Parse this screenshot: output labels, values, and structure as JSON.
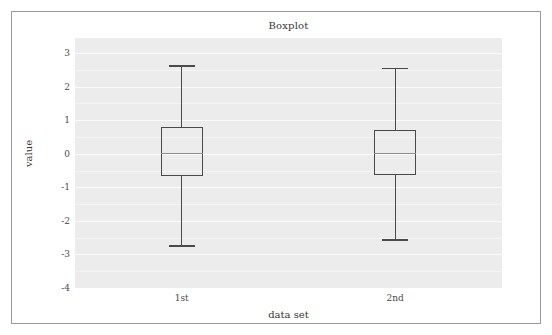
{
  "figure": {
    "title": "Boxplot",
    "xlabel": "data set",
    "ylabel": "value",
    "background_color": "#ffffff",
    "plot_background_color": "#ebebeb",
    "gridline_color": "#ffffff",
    "border_color": "#9a9a9a",
    "artist_color": "#4a4a4a",
    "median_color": "#8d8d8d"
  },
  "chart_data": {
    "type": "box",
    "title": "Boxplot",
    "xlabel": "data set",
    "ylabel": "value",
    "categories": [
      "1st",
      "2nd"
    ],
    "xtick_labels": [
      "1st",
      "2nd"
    ],
    "ytick_labels": [
      "3",
      "2",
      "1",
      "0",
      "-1",
      "-2",
      "-3",
      "-4"
    ],
    "ytick_values": [
      3,
      2,
      1,
      0,
      -1,
      -2,
      -3,
      -4
    ],
    "ylim": [
      -4.0,
      3.45
    ],
    "xlim": [
      0.5,
      2.5
    ],
    "grid": true,
    "grid_axis": "y",
    "legend": false,
    "series": [
      {
        "name": "1st",
        "position": 1,
        "whisker_low": -2.72,
        "q1": -0.67,
        "median": 0.02,
        "q3": 0.79,
        "whisker_high": 2.64,
        "outliers": []
      },
      {
        "name": "2nd",
        "position": 2,
        "whisker_low": -2.55,
        "q1": -0.63,
        "median": 0.01,
        "q3": 0.72,
        "whisker_high": 2.57,
        "outliers": []
      }
    ]
  }
}
